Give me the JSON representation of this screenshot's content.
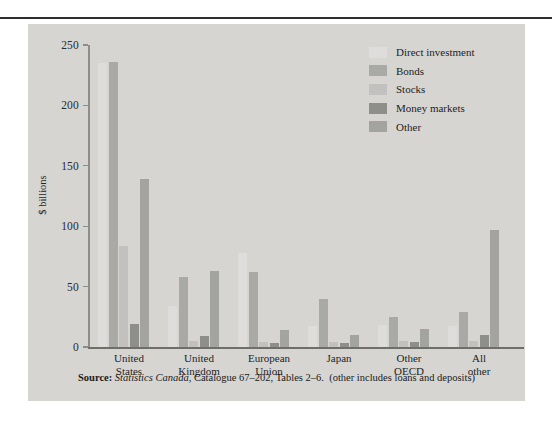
{
  "chart_data": {
    "type": "bar",
    "title": "",
    "subtitle": "",
    "xlabel": "",
    "ylabel": "$ billions",
    "ylim": [
      0,
      250
    ],
    "yticks": [
      0,
      50,
      100,
      150,
      200,
      250
    ],
    "ytick_labels": [
      "0",
      "50",
      "100",
      "150",
      "200",
      "250"
    ],
    "grid": false,
    "legend_position": "top-right",
    "categories": [
      "United\nStates",
      "United\nKingdom",
      "European\nUnion",
      "Japan",
      "Other\nOECD",
      "All other"
    ],
    "series": [
      {
        "name": "Direct investment",
        "color": "#dedddb",
        "values": [
          235,
          34,
          78,
          17,
          18,
          17
        ]
      },
      {
        "name": "Bonds",
        "color": "#a9a9a6",
        "values": [
          236,
          58,
          62,
          40,
          25,
          29
        ]
      },
      {
        "name": "Stocks",
        "color": "#c2c1bf",
        "values": [
          84,
          5,
          4,
          4,
          5,
          5
        ]
      },
      {
        "name": "Money markets",
        "color": "#8e8e8b",
        "values": [
          19,
          9,
          3,
          3,
          4,
          10
        ]
      },
      {
        "name": "Other",
        "color": "#a3a3a0",
        "values": [
          139,
          63,
          14,
          10,
          15,
          97
        ]
      }
    ],
    "source": {
      "prefix": "Source:",
      "publisher": "Statistics Canada",
      "detail": ", Catalogue 67–202, Tables 2–6.",
      "note": "(other includes loans and deposits)"
    }
  },
  "axis": {
    "y_title": "$ billions"
  },
  "colors": {
    "panel_background": "#d6d5d2",
    "page_background": "#ffffff",
    "rule": "#2e2e2e",
    "axis": "#8d8d8a",
    "text": "#1f1f1f"
  }
}
